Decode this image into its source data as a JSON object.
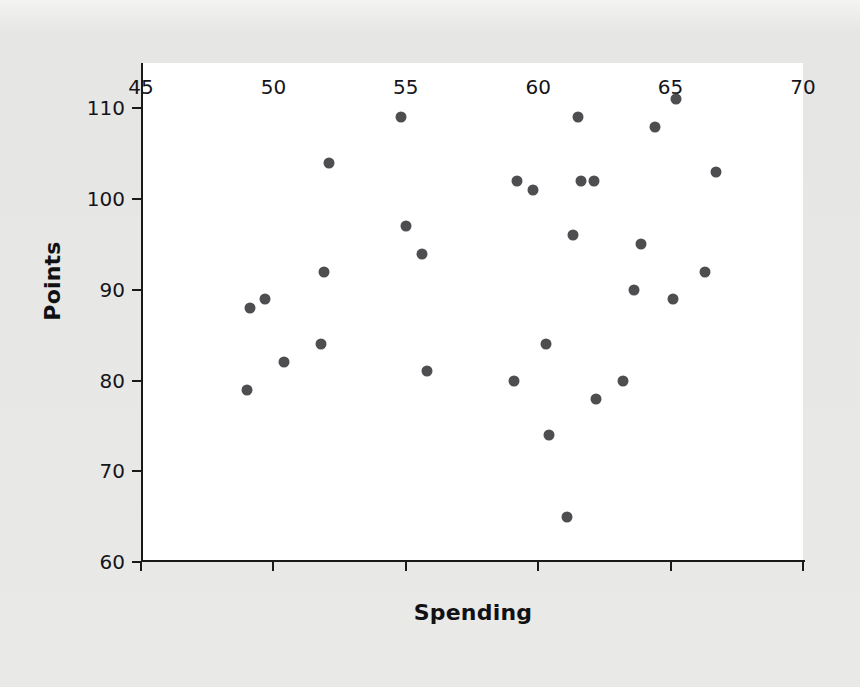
{
  "chart_data": {
    "type": "scatter",
    "title": "",
    "xlabel": "Spending",
    "ylabel": "Points",
    "xlim": [
      45,
      70
    ],
    "ylim": [
      60,
      115
    ],
    "xticks": [
      45,
      50,
      55,
      60,
      65,
      70
    ],
    "yticks": [
      60,
      70,
      80,
      90,
      100,
      110
    ],
    "grid": false,
    "legend": null,
    "marker_color": "#4e4e51",
    "axis_color": "#1a1a1a",
    "panel_color": "#ffffff",
    "background_color": "#e9e9e7",
    "points": [
      {
        "x": 49.0,
        "y": 79
      },
      {
        "x": 49.1,
        "y": 88
      },
      {
        "x": 49.7,
        "y": 89
      },
      {
        "x": 50.4,
        "y": 82
      },
      {
        "x": 51.8,
        "y": 84
      },
      {
        "x": 51.9,
        "y": 92
      },
      {
        "x": 52.1,
        "y": 104
      },
      {
        "x": 54.8,
        "y": 109
      },
      {
        "x": 55.0,
        "y": 97
      },
      {
        "x": 55.6,
        "y": 94
      },
      {
        "x": 55.8,
        "y": 81
      },
      {
        "x": 59.1,
        "y": 80
      },
      {
        "x": 59.2,
        "y": 102
      },
      {
        "x": 59.8,
        "y": 101
      },
      {
        "x": 60.3,
        "y": 84
      },
      {
        "x": 60.4,
        "y": 74
      },
      {
        "x": 61.1,
        "y": 65
      },
      {
        "x": 61.3,
        "y": 96
      },
      {
        "x": 61.5,
        "y": 109
      },
      {
        "x": 61.6,
        "y": 102
      },
      {
        "x": 62.1,
        "y": 102
      },
      {
        "x": 62.2,
        "y": 78
      },
      {
        "x": 63.2,
        "y": 80
      },
      {
        "x": 63.6,
        "y": 90
      },
      {
        "x": 63.9,
        "y": 95
      },
      {
        "x": 64.4,
        "y": 108
      },
      {
        "x": 65.1,
        "y": 89
      },
      {
        "x": 65.2,
        "y": 111
      },
      {
        "x": 66.3,
        "y": 92
      },
      {
        "x": 66.7,
        "y": 103
      }
    ]
  }
}
